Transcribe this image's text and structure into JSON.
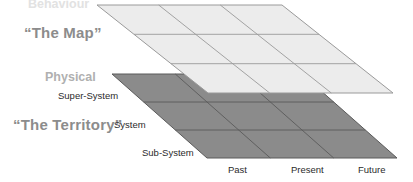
{
  "diagram": {
    "title_map": "“The Map”",
    "title_territory": "“The Territory”",
    "layer_top_caption": "Behaviour",
    "layer_bottom_caption": "Physical",
    "vertical_axis_labels": [
      "Super-System",
      "System",
      "Sub-System"
    ],
    "horizontal_axis_labels": [
      "Past",
      "Present",
      "Future"
    ],
    "colors": {
      "map_plane_fill": "#ececec",
      "map_plane_stroke": "#9a9a9a",
      "territory_plane_fill": "#8b8b8b",
      "territory_plane_stroke": "#5a5a5a",
      "title_text": "#8c8c8c",
      "caption_text": "#b0b0b0",
      "caption_text_faded": "#e2e2e2",
      "axis_text": "#2b2b2b",
      "background": "#ffffff"
    },
    "grid": {
      "rows": 3,
      "cols": 3
    }
  }
}
